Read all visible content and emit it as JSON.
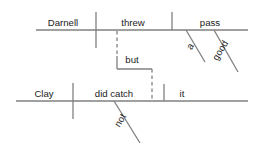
{
  "diagram": {
    "type": "reed-kellogg-sentence-diagram",
    "sentence": "Darnell threw a good pass, but Clay did not catch it.",
    "line_color": "#808080",
    "text_color": "#1a1a1a",
    "background_color": "#ffffff",
    "clauses": [
      {
        "id": "clause-top",
        "baseline": {
          "x1": 36,
          "x2": 248,
          "y": 30
        },
        "words": [
          {
            "name": "subject",
            "text": "Darnell",
            "x": 63,
            "y": 26
          },
          {
            "name": "verb",
            "text": "threw",
            "x": 133,
            "y": 26
          },
          {
            "name": "direct-object",
            "text": "pass",
            "x": 210,
            "y": 26
          }
        ],
        "dividers": [
          {
            "name": "subject-verb-divider",
            "x": 96,
            "y1": 12,
            "y2": 48,
            "crosses": true
          },
          {
            "name": "verb-object-divider",
            "x": 172,
            "y1": 12,
            "y2": 30,
            "crosses": false
          }
        ],
        "modifiers": [
          {
            "name": "article-modifier",
            "text": "a",
            "x1": 186,
            "y1": 30,
            "x2": 205,
            "y2": 62,
            "label_x": 193,
            "label_y": 48,
            "rotation": -59
          },
          {
            "name": "adjective-modifier",
            "text": "good",
            "x1": 214,
            "y1": 30,
            "x2": 238,
            "y2": 72,
            "label_x": 223,
            "label_y": 52,
            "rotation": -59
          }
        ]
      },
      {
        "id": "clause-bottom",
        "baseline": {
          "x1": 16,
          "x2": 248,
          "y": 101
        },
        "words": [
          {
            "name": "subject",
            "text": "Clay",
            "x": 44,
            "y": 97
          },
          {
            "name": "verb",
            "text": "did catch",
            "x": 114,
            "y": 97
          },
          {
            "name": "direct-object",
            "text": "it",
            "x": 182,
            "y": 97
          }
        ],
        "dividers": [
          {
            "name": "subject-verb-divider",
            "x": 73,
            "y1": 83,
            "y2": 119,
            "crosses": true
          },
          {
            "name": "verb-object-divider",
            "x": 164,
            "y1": 84,
            "y2": 101,
            "crosses": false
          }
        ],
        "modifiers": [
          {
            "name": "adverb-modifier",
            "text": "not",
            "x1": 114,
            "y1": 101,
            "x2": 140,
            "y2": 143,
            "label_x": 123,
            "label_y": 122,
            "rotation": -59
          }
        ]
      }
    ],
    "conjunction": {
      "name": "conjunction-but",
      "text": "but",
      "label_x": 132,
      "label_y": 63,
      "dashed_segments": [
        {
          "name": "upper-dashed-stem",
          "x1": 117,
          "y1": 31,
          "x2": 117,
          "y2": 56
        },
        {
          "name": "lower-dashed-stem",
          "x1": 152,
          "y1": 69,
          "x2": 152,
          "y2": 100
        }
      ],
      "solid_segments": [
        {
          "name": "left-bracket-arm",
          "x1": 117,
          "y1": 56,
          "x2": 117,
          "y2": 69
        },
        {
          "name": "bracket-crossbar",
          "x1": 117,
          "y1": 69,
          "x2": 152,
          "y2": 69
        }
      ]
    }
  }
}
